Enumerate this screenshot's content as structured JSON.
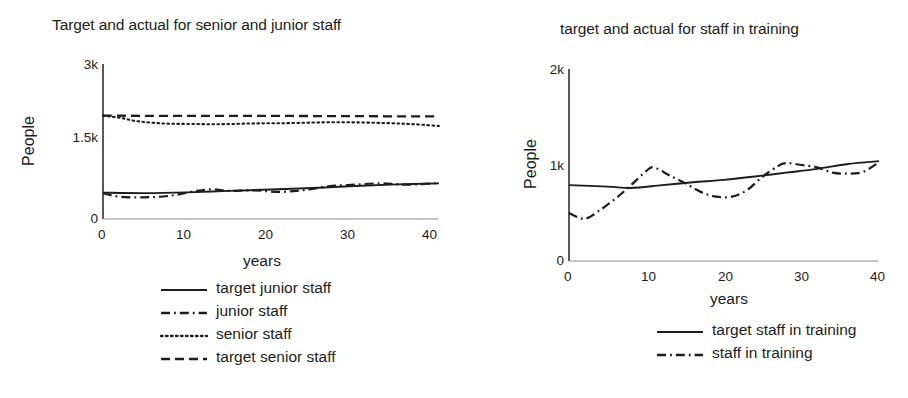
{
  "chart_data": [
    {
      "type": "line",
      "title": "Target and actual for senior and junior staff",
      "xlabel": "years",
      "ylabel": "People",
      "xlim": [
        0,
        40
      ],
      "ylim": [
        0,
        3000
      ],
      "xticks": [
        0,
        10,
        20,
        30,
        40
      ],
      "xticklabels": [
        "0",
        "10",
        "20",
        "30",
        "40"
      ],
      "yticks": [
        0,
        1500,
        3000
      ],
      "yticklabels": [
        "0",
        "1.5k",
        "3k"
      ],
      "grid": false,
      "legend_position": "below",
      "series": [
        {
          "name": "target junior staff",
          "style": "solid",
          "x": [
            0,
            5,
            10,
            15,
            20,
            25,
            30,
            35,
            40
          ],
          "values": [
            510,
            500,
            515,
            545,
            570,
            600,
            640,
            670,
            690
          ]
        },
        {
          "name": "junior staff",
          "style": "dash-dot",
          "x": [
            0,
            2,
            5,
            8,
            11,
            13,
            15,
            18,
            21,
            24,
            27,
            30,
            33,
            36,
            40
          ],
          "values": [
            500,
            430,
            420,
            450,
            540,
            575,
            545,
            555,
            525,
            560,
            635,
            665,
            690,
            665,
            695
          ]
        },
        {
          "name": "senior staff",
          "style": "dotted",
          "x": [
            0,
            2,
            4,
            7,
            10,
            14,
            18,
            22,
            26,
            30,
            34,
            37,
            40
          ],
          "values": [
            2000,
            1960,
            1895,
            1850,
            1840,
            1835,
            1850,
            1855,
            1870,
            1870,
            1855,
            1835,
            1800
          ]
        },
        {
          "name": "target senior staff",
          "style": "dashed",
          "x": [
            0,
            10,
            20,
            30,
            40
          ],
          "values": [
            2000,
            1995,
            1995,
            1990,
            1985
          ]
        }
      ]
    },
    {
      "type": "line",
      "title": "target and actual for staff in training",
      "xlabel": "years",
      "ylabel": "People",
      "xlim": [
        0,
        40
      ],
      "ylim": [
        0,
        2000
      ],
      "xticks": [
        0,
        10,
        20,
        30,
        40
      ],
      "xticklabels": [
        "0",
        "10",
        "20",
        "30",
        "40"
      ],
      "yticks": [
        0,
        1000,
        2000
      ],
      "yticklabels": [
        "0",
        "1k",
        "2k"
      ],
      "grid": false,
      "legend_position": "below",
      "series": [
        {
          "name": "target staff in training",
          "style": "solid",
          "x": [
            0,
            5,
            8,
            12,
            16,
            20,
            24,
            28,
            32,
            36,
            40
          ],
          "values": [
            790,
            775,
            760,
            790,
            820,
            845,
            880,
            920,
            960,
            1010,
            1040
          ]
        },
        {
          "name": "staff in training",
          "style": "dash-dot",
          "x": [
            0,
            2,
            4,
            6,
            8,
            10,
            11,
            13,
            15,
            17,
            19,
            21,
            23,
            25,
            27,
            28,
            30,
            32,
            34,
            36,
            38,
            40
          ],
          "values": [
            500,
            440,
            530,
            650,
            790,
            940,
            975,
            890,
            810,
            720,
            670,
            670,
            740,
            880,
            990,
            1020,
            1000,
            975,
            920,
            910,
            930,
            1030
          ]
        }
      ]
    }
  ],
  "left_panel": {
    "title": "Target and actual for senior and junior staff",
    "ylabel": "People",
    "xlabel": "years",
    "yticks": [
      "3k",
      "1.5k",
      "0"
    ],
    "xticks": [
      "0",
      "10",
      "20",
      "30",
      "40"
    ],
    "legend": [
      {
        "label": "target junior staff",
        "style": "solid"
      },
      {
        "label": "junior staff",
        "style": "dash-dot"
      },
      {
        "label": "senior staff",
        "style": "dotted"
      },
      {
        "label": "target senior staff",
        "style": "dashed"
      }
    ]
  },
  "right_panel": {
    "title": "target and actual for staff in training",
    "ylabel": "People",
    "xlabel": "years",
    "yticks": [
      "2k",
      "1k",
      "0"
    ],
    "xticks": [
      "0",
      "10",
      "20",
      "30",
      "40"
    ],
    "legend": [
      {
        "label": "target staff in training",
        "style": "solid"
      },
      {
        "label": "staff in training",
        "style": "dash-dot"
      }
    ]
  },
  "colors": {
    "ink": "#1c1c1c",
    "axis": "#4a4a4a",
    "background": "#ffffff"
  }
}
